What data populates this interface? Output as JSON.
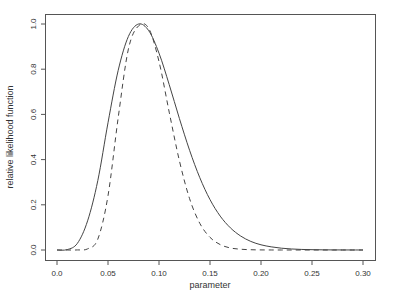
{
  "chart_data": {
    "type": "line",
    "title": "",
    "xlabel": "parameter",
    "ylabel": "relative likelihood function",
    "xlim": [
      0.0,
      0.3
    ],
    "ylim": [
      0.0,
      1.0
    ],
    "grid": false,
    "legend": null,
    "x_ticks": [
      "0.0",
      "0.05",
      "0.10",
      "0.15",
      "0.20",
      "0.25",
      "0.30"
    ],
    "y_ticks": [
      "0.0",
      "0.2",
      "0.4",
      "0.6",
      "0.8",
      "1.0"
    ],
    "x": [
      0.0,
      0.01,
      0.02,
      0.03,
      0.04,
      0.05,
      0.06,
      0.07,
      0.08,
      0.09,
      0.1,
      0.11,
      0.12,
      0.13,
      0.14,
      0.15,
      0.16,
      0.17,
      0.18,
      0.19,
      0.2,
      0.21,
      0.22,
      0.23,
      0.24,
      0.25,
      0.26,
      0.27,
      0.28,
      0.29,
      0.3
    ],
    "series": [
      {
        "name": "solid curve",
        "style": "solid",
        "mode": 0.08,
        "values": [
          0.0,
          0.0017,
          0.0295,
          0.129,
          0.307,
          0.563,
          0.795,
          0.945,
          1.0,
          0.97,
          0.871,
          0.732,
          0.582,
          0.441,
          0.32,
          0.223,
          0.15,
          0.098,
          0.062,
          0.038,
          0.023,
          0.014,
          0.008,
          0.0045,
          0.0025,
          0.0014,
          0.0008,
          0.0004,
          0.0002,
          0.0001,
          0.0001
        ]
      },
      {
        "name": "dashed curve",
        "style": "dashed",
        "mode": 0.085,
        "values": [
          0.0,
          0.0,
          0.0003,
          0.005,
          0.048,
          0.24,
          0.586,
          0.889,
          0.992,
          0.98,
          0.834,
          0.61,
          0.395,
          0.227,
          0.118,
          0.056,
          0.024,
          0.009,
          0.0035,
          0.0012,
          0.0004,
          0.0001,
          0.0,
          0.0,
          0.0,
          0.0,
          0.0,
          0.0,
          0.0,
          0.0,
          0.0
        ]
      }
    ]
  },
  "colors": {
    "axis": "#555555",
    "solid_line": "#444444",
    "dashed_line": "#444444",
    "text": "#333333"
  }
}
